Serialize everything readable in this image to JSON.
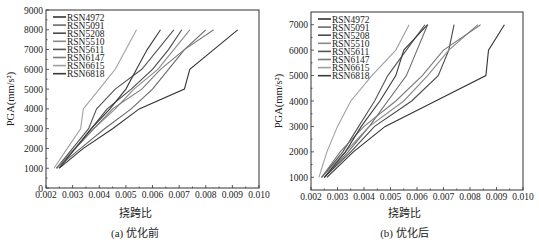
{
  "chart_data": [
    {
      "type": "line",
      "title": "",
      "caption": "(a) 优化前",
      "xlabel": "挠跨比",
      "ylabel": "PGA(mm/s²)",
      "xlim": [
        0.002,
        0.01
      ],
      "ylim": [
        0,
        9000
      ],
      "xticks": [
        "0.002",
        "0.003",
        "0.004",
        "0.005",
        "0.006",
        "0.007",
        "0.008",
        "0.009",
        "0.010"
      ],
      "yticks": [
        "0",
        "1000",
        "2000",
        "3000",
        "4000",
        "5000",
        "6000",
        "7000",
        "8000",
        "9000"
      ],
      "grid": false,
      "legend_position": "upper left",
      "y": [
        1000,
        2000,
        3000,
        4000,
        5000,
        6000,
        7000,
        8000
      ],
      "series": [
        {
          "name": "RSN4972",
          "color": "#333333",
          "x": [
            0.0025,
            0.0034,
            0.0045,
            0.0055,
            0.0072,
            0.0074,
            0.0083,
            0.0092
          ]
        },
        {
          "name": "RSN5091",
          "color": "#6a6a6a",
          "x": [
            0.0024,
            0.0033,
            0.0042,
            0.0052,
            0.006,
            0.0066,
            0.0072,
            0.008
          ]
        },
        {
          "name": "RSN5208",
          "color": "#4a4a4a",
          "x": [
            0.0024,
            0.0031,
            0.0037,
            0.0043,
            0.0052,
            0.006,
            0.0066,
            0.0071
          ]
        },
        {
          "name": "RSN5510",
          "color": "#8a8a8a",
          "x": [
            0.0024,
            0.0031,
            0.0038,
            0.0046,
            0.0053,
            0.0062,
            0.0068,
            0.0074
          ]
        },
        {
          "name": "RSN5611",
          "color": "#555555",
          "x": [
            0.0024,
            0.003,
            0.0036,
            0.0039,
            0.0046,
            0.0056,
            0.0062,
            0.0068
          ]
        },
        {
          "name": "RSN6147",
          "color": "#7a7a7a",
          "x": [
            0.0024,
            0.0031,
            0.0038,
            0.0045,
            0.0056,
            0.0063,
            0.0072,
            0.0083
          ]
        },
        {
          "name": "RSN6615",
          "color": "#a0a0a0",
          "x": [
            0.0023,
            0.0028,
            0.0033,
            0.0034,
            0.004,
            0.0046,
            0.005,
            0.0054
          ]
        },
        {
          "name": "RSN6818",
          "color": "#3a3a3a",
          "x": [
            0.0025,
            0.0031,
            0.0037,
            0.0044,
            0.005,
            0.0054,
            0.0058,
            0.0063
          ]
        }
      ]
    },
    {
      "type": "line",
      "title": "",
      "caption": "(b) 优化后",
      "xlabel": "挠跨比",
      "ylabel": "PGA(mm/s²)",
      "xlim": [
        0.002,
        0.01
      ],
      "ylim": [
        500,
        7500
      ],
      "xticks": [
        "0.002",
        "0.003",
        "0.004",
        "0.005",
        "0.006",
        "0.007",
        "0.008",
        "0.009",
        "0.010"
      ],
      "yticks": [
        "1000",
        "2000",
        "3000",
        "4000",
        "5000",
        "6000",
        "7000"
      ],
      "grid": false,
      "legend_position": "upper left",
      "y": [
        1000,
        2000,
        3000,
        4000,
        5000,
        6000,
        7000
      ],
      "series": [
        {
          "name": "RSN4972",
          "color": "#333333",
          "x": [
            0.0026,
            0.0036,
            0.0048,
            0.0067,
            0.0086,
            0.0087,
            0.0093
          ]
        },
        {
          "name": "RSN5091",
          "color": "#6a6a6a",
          "x": [
            0.0025,
            0.0034,
            0.0042,
            0.0049,
            0.0056,
            0.006,
            0.0064
          ]
        },
        {
          "name": "RSN5208",
          "color": "#4a4a4a",
          "x": [
            0.0025,
            0.0035,
            0.0044,
            0.0058,
            0.0068,
            0.0072,
            0.0074
          ]
        },
        {
          "name": "RSN5510",
          "color": "#8a8a8a",
          "x": [
            0.0024,
            0.0033,
            0.0042,
            0.0055,
            0.0064,
            0.0072,
            0.0083
          ]
        },
        {
          "name": "RSN5611",
          "color": "#555555",
          "x": [
            0.0024,
            0.0032,
            0.0038,
            0.0044,
            0.0049,
            0.0056,
            0.0063
          ]
        },
        {
          "name": "RSN6147",
          "color": "#7a7a7a",
          "x": [
            0.0024,
            0.0031,
            0.004,
            0.0052,
            0.0062,
            0.007,
            0.0084
          ]
        },
        {
          "name": "RSN6615",
          "color": "#a0a0a0",
          "x": [
            0.0023,
            0.0026,
            0.003,
            0.0035,
            0.0043,
            0.0052,
            0.0057
          ]
        },
        {
          "name": "RSN6818",
          "color": "#3a3a3a",
          "x": [
            0.0025,
            0.0033,
            0.0039,
            0.0046,
            0.0052,
            0.0055,
            0.0064
          ]
        }
      ]
    }
  ]
}
